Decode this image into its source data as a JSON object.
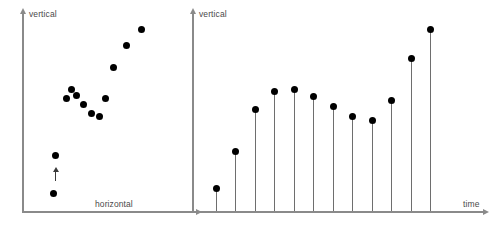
{
  "figure": {
    "background": "#ffffff",
    "axis_color": "#8a8a8a",
    "marker_color": "#000000",
    "stem_color": "#6e6e6e",
    "label_color": "#4a4a4a"
  },
  "chart_data": [
    {
      "type": "scatter",
      "panel": "left",
      "title": "",
      "xlabel": "horizontal",
      "ylabel": "vertical",
      "xlim": [
        0,
        100
      ],
      "ylim": [
        0,
        100
      ],
      "grid": false,
      "legend": "none",
      "x": [
        16,
        17,
        24,
        27,
        30,
        34,
        39,
        44,
        48,
        53,
        61,
        70
      ],
      "y": [
        5,
        26,
        57,
        62,
        59,
        54,
        49,
        47,
        57,
        74,
        86,
        95
      ],
      "annotations": [
        {
          "type": "arrow",
          "direction": "up",
          "x": 17,
          "y": 16,
          "label": ""
        }
      ]
    },
    {
      "type": "stem",
      "panel": "right",
      "title": "",
      "xlabel": "time",
      "ylabel": "vertical",
      "xlim": [
        0,
        13
      ],
      "ylim": [
        0,
        100
      ],
      "grid": false,
      "legend": "none",
      "categories": [
        "1",
        "2",
        "3",
        "4",
        "5",
        "6",
        "7",
        "8",
        "9",
        "10",
        "11",
        "12"
      ],
      "x": [
        1,
        2,
        3,
        4,
        5,
        6,
        7,
        8,
        9,
        10,
        11,
        12
      ],
      "values": [
        8,
        28,
        51,
        61,
        62,
        58,
        53,
        47,
        45,
        56,
        79,
        95
      ],
      "baseline": 0
    }
  ],
  "left_panel": {
    "y_axis_label": "vertical",
    "x_axis_label": "horizontal"
  },
  "right_panel": {
    "y_axis_label": "vertical",
    "x_axis_label": "time"
  }
}
